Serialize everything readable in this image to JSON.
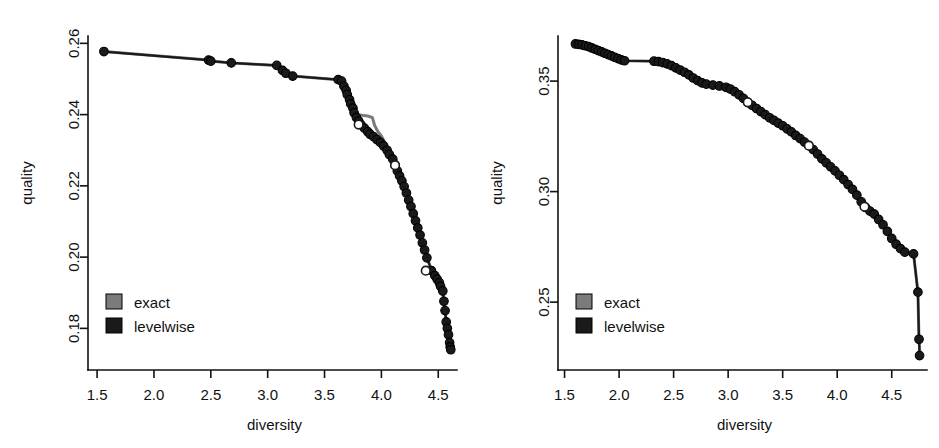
{
  "figure": {
    "panel_count": 2,
    "background_color": "#ffffff",
    "exact_color": "#7b7b7b",
    "levelwise_color": "#1a1a1a"
  },
  "chart_data": [
    {
      "type": "scatter",
      "panel": "left",
      "title": "",
      "xlabel": "diversity",
      "ylabel": "quality",
      "xlim": [
        1.42,
        4.7
      ],
      "ylim": [
        0.17,
        0.2615
      ],
      "xticks": [
        1.5,
        2.0,
        2.5,
        3.0,
        3.5,
        4.0,
        4.5
      ],
      "xticklabels": [
        "1.5",
        "2.0",
        "2.5",
        "3.0",
        "3.5",
        "4.0",
        "4.5"
      ],
      "yticks": [
        0.18,
        0.2,
        0.22,
        0.24,
        0.26
      ],
      "yticklabels": [
        "0.18",
        "0.20",
        "0.22",
        "0.24",
        "0.26"
      ],
      "grid": false,
      "legend": {
        "position": "bottom-left",
        "entries": [
          {
            "label": "exact",
            "color": "#7b7b7b",
            "marker": "square"
          },
          {
            "label": "levelwise",
            "color": "#1a1a1a",
            "marker": "square"
          }
        ]
      },
      "series": [
        {
          "name": "exact",
          "color": "#7b7b7b",
          "style": "line",
          "points": [
            [
              1.56,
              0.2577
            ],
            [
              2.48,
              0.2553
            ],
            [
              2.52,
              0.255
            ],
            [
              2.68,
              0.2545
            ],
            [
              3.08,
              0.2538
            ],
            [
              3.14,
              0.252
            ],
            [
              3.17,
              0.2514
            ],
            [
              3.22,
              0.2508
            ],
            [
              3.62,
              0.2498
            ],
            [
              3.66,
              0.2492
            ],
            [
              3.69,
              0.247
            ],
            [
              3.71,
              0.2455
            ],
            [
              3.73,
              0.2442
            ],
            [
              3.75,
              0.242
            ],
            [
              3.77,
              0.2408
            ],
            [
              3.8,
              0.24
            ],
            [
              3.83,
              0.2398
            ],
            [
              3.88,
              0.2396
            ],
            [
              3.92,
              0.2392
            ],
            [
              3.94,
              0.237
            ],
            [
              3.97,
              0.2352
            ],
            [
              4.0,
              0.234
            ],
            [
              4.03,
              0.2322
            ],
            [
              4.06,
              0.2305
            ],
            [
              4.09,
              0.2285
            ],
            [
              4.12,
              0.226
            ],
            [
              4.15,
              0.2238
            ],
            [
              4.18,
              0.2215
            ],
            [
              4.21,
              0.219
            ],
            [
              4.24,
              0.216
            ],
            [
              4.27,
              0.2128
            ],
            [
              4.3,
              0.21
            ],
            [
              4.33,
              0.2065
            ],
            [
              4.36,
              0.2035
            ],
            [
              4.4,
              0.2
            ],
            [
              4.44,
              0.1965
            ],
            [
              4.47,
              0.1945
            ],
            [
              4.5,
              0.1928
            ],
            [
              4.53,
              0.1912
            ],
            [
              4.55,
              0.188
            ],
            [
              4.57,
              0.182
            ],
            [
              4.58,
              0.18
            ],
            [
              4.6,
              0.176
            ],
            [
              4.61,
              0.1742
            ]
          ]
        },
        {
          "name": "levelwise",
          "color": "#1a1a1a",
          "style": "line+markers",
          "points": [
            [
              1.56,
              0.2577
            ],
            [
              2.48,
              0.2553
            ],
            [
              2.5,
              0.255
            ],
            [
              2.68,
              0.2545
            ],
            [
              3.08,
              0.2538
            ],
            [
              3.13,
              0.2524
            ],
            [
              3.16,
              0.2516
            ],
            [
              3.22,
              0.2508
            ],
            [
              3.62,
              0.2498
            ],
            [
              3.65,
              0.2494
            ],
            [
              3.67,
              0.248
            ],
            [
              3.69,
              0.2468
            ],
            [
              3.7,
              0.2456
            ],
            [
              3.72,
              0.2442
            ],
            [
              3.73,
              0.243
            ],
            [
              3.75,
              0.2418
            ],
            [
              3.76,
              0.2405
            ],
            [
              3.78,
              0.2392
            ],
            [
              3.8,
              0.2382
            ],
            [
              3.82,
              0.2372
            ],
            [
              3.85,
              0.2362
            ],
            [
              3.88,
              0.2352
            ],
            [
              3.9,
              0.2345
            ],
            [
              3.93,
              0.2338
            ],
            [
              3.96,
              0.233
            ],
            [
              3.99,
              0.2322
            ],
            [
              4.02,
              0.2312
            ],
            [
              4.05,
              0.23
            ],
            [
              4.07,
              0.2288
            ],
            [
              4.1,
              0.2275
            ],
            [
              4.12,
              0.2258
            ],
            [
              4.14,
              0.2242
            ],
            [
              4.16,
              0.2228
            ],
            [
              4.18,
              0.2214
            ],
            [
              4.2,
              0.2198
            ],
            [
              4.22,
              0.218
            ],
            [
              4.24,
              0.216
            ],
            [
              4.26,
              0.2142
            ],
            [
              4.28,
              0.2122
            ],
            [
              4.3,
              0.2102
            ],
            [
              4.32,
              0.2082
            ],
            [
              4.34,
              0.2062
            ],
            [
              4.36,
              0.204
            ],
            [
              4.38,
              0.202
            ],
            [
              4.4,
              0.1998
            ],
            [
              4.44,
              0.1962
            ],
            [
              4.47,
              0.1948
            ],
            [
              4.49,
              0.1938
            ],
            [
              4.51,
              0.1928
            ],
            [
              4.52,
              0.1918
            ],
            [
              4.54,
              0.1905
            ],
            [
              4.55,
              0.1876
            ],
            [
              4.56,
              0.185
            ],
            [
              4.57,
              0.1818
            ],
            [
              4.58,
              0.18
            ],
            [
              4.59,
              0.1782
            ],
            [
              4.6,
              0.176
            ],
            [
              4.605,
              0.1748
            ],
            [
              4.61,
              0.174
            ]
          ]
        }
      ],
      "outliers": [
        {
          "x": 4.39,
          "y": 0.1962,
          "marker": "open-circle"
        },
        {
          "x": 3.8,
          "y": 0.2372,
          "marker": "open-circle"
        },
        {
          "x": 4.12,
          "y": 0.2258,
          "marker": "open-circle"
        }
      ]
    },
    {
      "type": "scatter",
      "panel": "right",
      "title": "",
      "xlabel": "diversity",
      "ylabel": "quality",
      "xlim": [
        1.44,
        4.86
      ],
      "ylim": [
        0.222,
        0.3695
      ],
      "xticks": [
        1.5,
        2.0,
        2.5,
        3.0,
        3.5,
        4.0,
        4.5
      ],
      "xticklabels": [
        "1.5",
        "2.0",
        "2.5",
        "3.0",
        "3.5",
        "4.0",
        "4.5"
      ],
      "yticks": [
        0.25,
        0.3,
        0.35
      ],
      "yticklabels": [
        "0.25",
        "0.30",
        "0.35"
      ],
      "grid": false,
      "legend": {
        "position": "bottom-left",
        "entries": [
          {
            "label": "exact",
            "color": "#7b7b7b",
            "marker": "square"
          },
          {
            "label": "levelwise",
            "color": "#1a1a1a",
            "marker": "square"
          }
        ]
      },
      "series": [
        {
          "name": "exact",
          "color": "#7b7b7b",
          "style": "line",
          "points": [
            [
              1.6,
              0.3668
            ],
            [
              1.7,
              0.366
            ],
            [
              1.8,
              0.364
            ],
            [
              1.9,
              0.3618
            ],
            [
              2.0,
              0.36
            ],
            [
              2.06,
              0.3592
            ],
            [
              2.32,
              0.359
            ],
            [
              2.4,
              0.3585
            ],
            [
              2.5,
              0.357
            ],
            [
              2.6,
              0.3545
            ],
            [
              2.7,
              0.3512
            ],
            [
              2.78,
              0.349
            ],
            [
              2.86,
              0.3482
            ],
            [
              2.95,
              0.3478
            ],
            [
              3.02,
              0.3468
            ],
            [
              3.1,
              0.344
            ],
            [
              3.2,
              0.34
            ],
            [
              3.3,
              0.3362
            ],
            [
              3.4,
              0.333
            ],
            [
              3.5,
              0.3298
            ],
            [
              3.6,
              0.3262
            ],
            [
              3.7,
              0.3225
            ],
            [
              3.78,
              0.319
            ],
            [
              3.86,
              0.3148
            ],
            [
              3.95,
              0.311
            ],
            [
              4.02,
              0.3075
            ],
            [
              4.1,
              0.3032
            ],
            [
              4.18,
              0.2985
            ],
            [
              4.25,
              0.2932
            ],
            [
              4.32,
              0.2905
            ],
            [
              4.4,
              0.2862
            ],
            [
              4.48,
              0.2805
            ],
            [
              4.55,
              0.276
            ],
            [
              4.62,
              0.2725
            ],
            [
              4.7,
              0.2718
            ],
            [
              4.74,
              0.2545
            ],
            [
              4.75,
              0.233
            ],
            [
              4.76,
              0.226
            ]
          ]
        },
        {
          "name": "levelwise",
          "color": "#1a1a1a",
          "style": "line+markers",
          "points": [
            [
              1.6,
              0.3668
            ],
            [
              1.63,
              0.3666
            ],
            [
              1.66,
              0.3664
            ],
            [
              1.69,
              0.366
            ],
            [
              1.72,
              0.3656
            ],
            [
              1.75,
              0.365
            ],
            [
              1.78,
              0.3644
            ],
            [
              1.81,
              0.3638
            ],
            [
              1.84,
              0.3632
            ],
            [
              1.87,
              0.3626
            ],
            [
              1.9,
              0.362
            ],
            [
              1.93,
              0.3614
            ],
            [
              1.96,
              0.3608
            ],
            [
              1.99,
              0.3602
            ],
            [
              2.02,
              0.3596
            ],
            [
              2.05,
              0.3592
            ],
            [
              2.32,
              0.359
            ],
            [
              2.36,
              0.3588
            ],
            [
              2.4,
              0.3584
            ],
            [
              2.44,
              0.3578
            ],
            [
              2.48,
              0.357
            ],
            [
              2.52,
              0.356
            ],
            [
              2.56,
              0.355
            ],
            [
              2.6,
              0.354
            ],
            [
              2.64,
              0.3528
            ],
            [
              2.68,
              0.3514
            ],
            [
              2.72,
              0.3502
            ],
            [
              2.76,
              0.3492
            ],
            [
              2.8,
              0.3486
            ],
            [
              2.86,
              0.3482
            ],
            [
              2.92,
              0.3478
            ],
            [
              2.98,
              0.3472
            ],
            [
              3.02,
              0.3464
            ],
            [
              3.06,
              0.3452
            ],
            [
              3.1,
              0.3438
            ],
            [
              3.14,
              0.3422
            ],
            [
              3.18,
              0.3404
            ],
            [
              3.22,
              0.339
            ],
            [
              3.26,
              0.3376
            ],
            [
              3.3,
              0.3362
            ],
            [
              3.34,
              0.3348
            ],
            [
              3.38,
              0.3334
            ],
            [
              3.42,
              0.3322
            ],
            [
              3.46,
              0.331
            ],
            [
              3.5,
              0.3298
            ],
            [
              3.54,
              0.3284
            ],
            [
              3.58,
              0.327
            ],
            [
              3.62,
              0.3254
            ],
            [
              3.66,
              0.324
            ],
            [
              3.7,
              0.3224
            ],
            [
              3.74,
              0.3208
            ],
            [
              3.78,
              0.319
            ],
            [
              3.82,
              0.317
            ],
            [
              3.86,
              0.3148
            ],
            [
              3.9,
              0.313
            ],
            [
              3.94,
              0.3112
            ],
            [
              3.98,
              0.3094
            ],
            [
              4.02,
              0.3074
            ],
            [
              4.06,
              0.3054
            ],
            [
              4.1,
              0.3032
            ],
            [
              4.14,
              0.301
            ],
            [
              4.18,
              0.2984
            ],
            [
              4.22,
              0.2954
            ],
            [
              4.26,
              0.2928
            ],
            [
              4.3,
              0.2912
            ],
            [
              4.34,
              0.2898
            ],
            [
              4.38,
              0.2874
            ],
            [
              4.42,
              0.285
            ],
            [
              4.46,
              0.282
            ],
            [
              4.5,
              0.2788
            ],
            [
              4.54,
              0.2762
            ],
            [
              4.58,
              0.2742
            ],
            [
              4.62,
              0.2726
            ],
            [
              4.7,
              0.2718
            ],
            [
              4.74,
              0.2545
            ],
            [
              4.75,
              0.2332
            ],
            [
              4.755,
              0.2258
            ]
          ]
        }
      ],
      "outliers": [
        {
          "x": 4.25,
          "y": 0.2932,
          "marker": "open-circle"
        },
        {
          "x": 3.74,
          "y": 0.3208,
          "marker": "open-circle"
        },
        {
          "x": 3.18,
          "y": 0.3404,
          "marker": "open-circle"
        }
      ]
    }
  ]
}
